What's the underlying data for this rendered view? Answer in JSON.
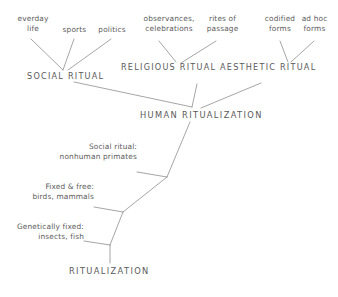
{
  "diagram": {
    "line_color": "#8e8e8e",
    "text_color": "#5b5b5b",
    "leaf_labels": [
      {
        "id": "everyday-life",
        "text": "everday\nlife"
      },
      {
        "id": "sports",
        "text": "sports"
      },
      {
        "id": "politics",
        "text": "politics"
      },
      {
        "id": "observances",
        "text": "observances,\ncelebrations"
      },
      {
        "id": "rites-of-passage",
        "text": "rites of\npassage"
      },
      {
        "id": "codified-forms",
        "text": "codified\nforms"
      },
      {
        "id": "ad-hoc-forms",
        "text": "ad hoc\nforms"
      }
    ],
    "category_nodes": [
      {
        "id": "social-ritual",
        "text": "SOCIAL RITUAL"
      },
      {
        "id": "religious-ritual",
        "text": "RELIGIOUS RITUAL"
      },
      {
        "id": "aesthetic-ritual",
        "text": "AESTHETIC RITUAL"
      }
    ],
    "human_node": {
      "id": "human-ritualization",
      "text": "HUMAN RITUALIZATION"
    },
    "evolution_labels": [
      {
        "id": "social-ritual-primates",
        "text": "Social ritual:\nnonhuman primates"
      },
      {
        "id": "fixed-and-free",
        "text": "Fixed & free:\nbirds, mammals"
      },
      {
        "id": "genetically-fixed",
        "text": "Genetically fixed:\ninsects, fish"
      }
    ],
    "root_node": {
      "id": "ritualization",
      "text": "RITUALIZATION"
    }
  }
}
